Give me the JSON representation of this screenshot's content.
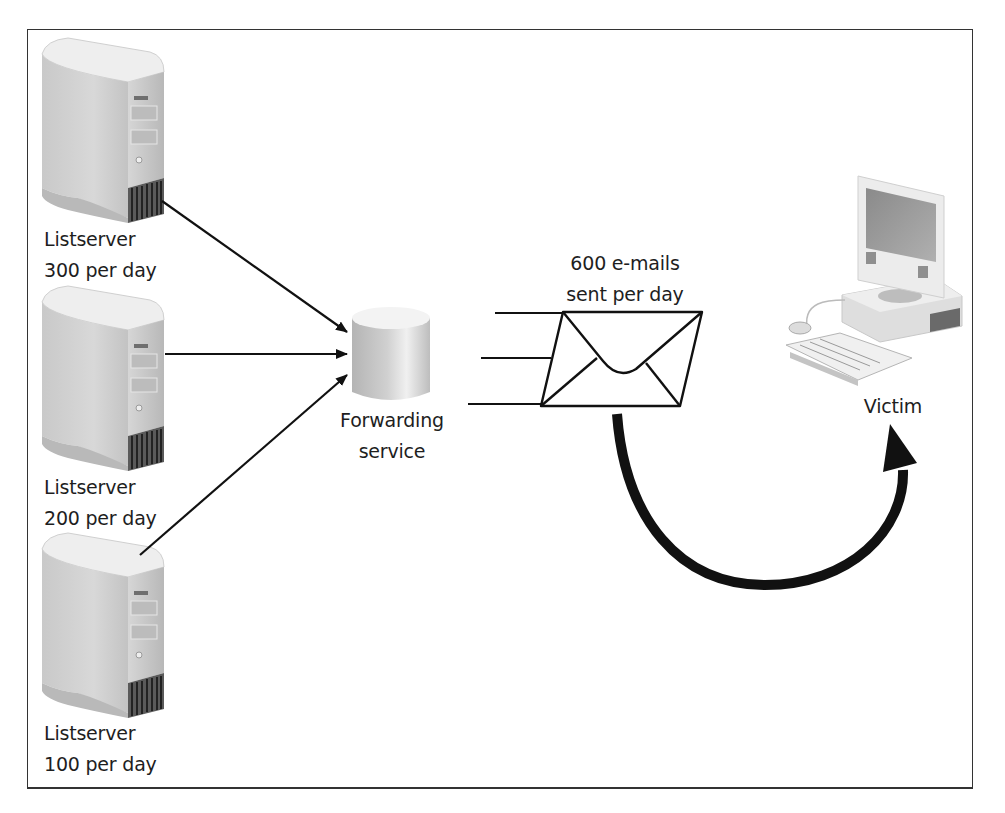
{
  "diagram": {
    "type": "email-bombing-via-listservers",
    "nodes": [
      {
        "id": "listserver-1",
        "label_line1": "Listserver",
        "label_line2": "300 per day",
        "icon": "server-tower-icon"
      },
      {
        "id": "listserver-2",
        "label_line1": "Listserver",
        "label_line2": "200 per day",
        "icon": "server-tower-icon"
      },
      {
        "id": "listserver-3",
        "label_line1": "Listserver",
        "label_line2": "100 per day",
        "icon": "server-tower-icon"
      },
      {
        "id": "forwarding",
        "label_line1": "Forwarding",
        "label_line2": "service",
        "icon": "database-cylinder-icon"
      },
      {
        "id": "email",
        "label_line1": "600 e-mails",
        "label_line2": "sent per day",
        "icon": "envelope-icon"
      },
      {
        "id": "victim",
        "label_line1": "Victim",
        "icon": "desktop-computer-icon"
      }
    ],
    "edges": [
      {
        "from": "listserver-1",
        "to": "forwarding"
      },
      {
        "from": "listserver-2",
        "to": "forwarding"
      },
      {
        "from": "listserver-3",
        "to": "forwarding"
      },
      {
        "from": "email",
        "to": "victim",
        "style": "thick-curved"
      }
    ]
  },
  "colors": {
    "line": "#111111",
    "border": "#333333",
    "text": "#1e1e1e",
    "server_body": "#cfcfcf",
    "server_top": "#ececec"
  }
}
